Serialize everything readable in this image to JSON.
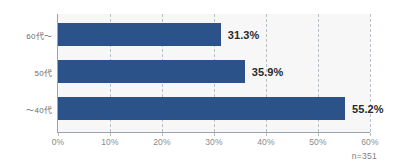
{
  "chart_data": {
    "type": "bar",
    "orientation": "horizontal",
    "title": "",
    "subtitle": "",
    "xlabel": "",
    "ylabel": "",
    "categories": [
      "60代〜",
      "50代",
      "〜40代"
    ],
    "values": [
      31.3,
      35.9,
      55.2
    ],
    "value_labels": [
      "31.3%",
      "35.9%",
      "55.2%"
    ],
    "series": [
      {
        "name": "",
        "values": [
          31.3,
          35.9,
          55.2
        ]
      }
    ],
    "xlim": [
      0,
      60
    ],
    "xticks": [
      0,
      10,
      20,
      30,
      40,
      50,
      60
    ],
    "xtick_labels": [
      "0%",
      "10%",
      "20%",
      "30%",
      "40%",
      "50%",
      "60%"
    ],
    "grid": "vertical-dashed",
    "legend": "none",
    "annotation": "n=351",
    "colors": {
      "bar": "#2b5289",
      "plot_background": "#f7f7f7",
      "figure_background": "#ffffff",
      "gridline": "#b9bfc6",
      "axis_line": "#9aa3ad",
      "value_label_text": "#2a2a2a",
      "tick_label_text": "#8a8a8a",
      "category_label_text": "#6b6b6b",
      "annotation_text": "#7d7d7d"
    }
  },
  "rows": [
    {
      "label": "60代〜",
      "value_label": "31.3%"
    },
    {
      "label": "50代",
      "value_label": "35.9%"
    },
    {
      "label": "〜40代",
      "value_label": "55.2%"
    }
  ],
  "xticks": [
    {
      "label": "0%"
    },
    {
      "label": "10%"
    },
    {
      "label": "20%"
    },
    {
      "label": "30%"
    },
    {
      "label": "40%"
    },
    {
      "label": "50%"
    },
    {
      "label": "60%"
    }
  ],
  "footnote": {
    "text": "n=351"
  }
}
